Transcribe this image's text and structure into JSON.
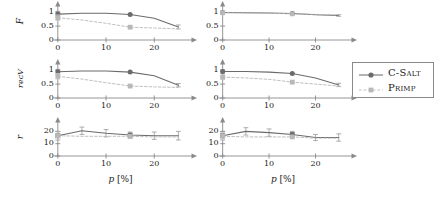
{
  "figure": {
    "width": 442,
    "height": 199,
    "background": "#ffffff",
    "colors": {
      "csalt": "#6b6b6b",
      "primp": "#b8b8b8",
      "axis": "#8a8a8a",
      "text": "#1a1a1a"
    }
  },
  "legend": {
    "position": "right-middle",
    "entries": [
      {
        "label": "C-Salt",
        "marker": "circle",
        "line": "solid",
        "color": "#6b6b6b"
      },
      {
        "label": "Primp",
        "marker": "square",
        "line": "dashed",
        "color": "#b8b8b8"
      }
    ]
  },
  "axis_titles": {
    "x_italic": "p",
    "x_unit": "[%]",
    "rows": [
      "F",
      "recV",
      "r"
    ]
  },
  "chart_data": [
    {
      "type": "line",
      "panel": "top-left",
      "title": "",
      "xlabel": "p [%]",
      "ylabel": "F",
      "xlim": [
        -1,
        27
      ],
      "ylim": [
        0,
        1.15
      ],
      "xticks": [
        0,
        10,
        20
      ],
      "yticks": [
        0,
        0.5,
        1
      ],
      "grid": false,
      "x": [
        0,
        5,
        10,
        15,
        20,
        25
      ],
      "series": [
        {
          "name": "C-Salt",
          "marker": "circle",
          "line": "solid",
          "color": "#6b6b6b",
          "values": [
            0.93,
            0.96,
            0.96,
            0.92,
            0.78,
            0.47
          ],
          "errors": [
            0.1,
            0.0,
            0.0,
            0.0,
            0.0,
            0.07
          ],
          "markers_at": [
            0,
            15
          ]
        },
        {
          "name": "Primp",
          "marker": "square",
          "line": "dashed",
          "color": "#b8b8b8",
          "values": [
            0.8,
            0.72,
            0.6,
            0.46,
            0.43,
            0.4
          ],
          "errors": [
            0.1,
            0.0,
            0.0,
            0.0,
            0.0,
            0.0
          ],
          "markers_at": [
            0,
            15
          ]
        }
      ]
    },
    {
      "type": "line",
      "panel": "top-right",
      "title": "",
      "xlabel": "p [%]",
      "ylabel": "F",
      "xlim": [
        -1,
        27
      ],
      "ylim": [
        0,
        1.15
      ],
      "xticks": [
        0,
        10,
        20
      ],
      "yticks": [
        0,
        0.5,
        1
      ],
      "grid": false,
      "x": [
        0,
        5,
        10,
        15,
        20,
        25
      ],
      "series": [
        {
          "name": "C-Salt",
          "marker": "circle",
          "line": "solid",
          "color": "#6b6b6b",
          "values": [
            0.99,
            0.98,
            0.97,
            0.95,
            0.91,
            0.88
          ],
          "errors": [
            0.04,
            0.0,
            0.0,
            0.0,
            0.0,
            0.03
          ],
          "markers_at": [
            0,
            15
          ]
        },
        {
          "name": "Primp",
          "marker": "square",
          "line": "dashed",
          "color": "#b8b8b8",
          "values": [
            0.98,
            0.97,
            0.96,
            0.94,
            0.92,
            0.9
          ],
          "errors": [
            0.04,
            0.0,
            0.0,
            0.0,
            0.0,
            0.0
          ],
          "markers_at": [
            0,
            15
          ]
        }
      ]
    },
    {
      "type": "line",
      "panel": "middle-left",
      "title": "",
      "xlabel": "p [%]",
      "ylabel": "recV",
      "xlim": [
        -1,
        27
      ],
      "ylim": [
        0,
        1.15
      ],
      "xticks": [
        0,
        10,
        20
      ],
      "yticks": [
        0,
        0.5,
        1
      ],
      "grid": false,
      "x": [
        0,
        5,
        10,
        15,
        20,
        25
      ],
      "series": [
        {
          "name": "C-Salt",
          "marker": "circle",
          "line": "solid",
          "color": "#6b6b6b",
          "values": [
            0.94,
            0.97,
            0.97,
            0.93,
            0.8,
            0.46
          ],
          "errors": [
            0.09,
            0.0,
            0.0,
            0.0,
            0.0,
            0.06
          ],
          "markers_at": [
            0,
            15
          ]
        },
        {
          "name": "Primp",
          "marker": "square",
          "line": "dashed",
          "color": "#b8b8b8",
          "values": [
            0.78,
            0.68,
            0.55,
            0.43,
            0.4,
            0.38
          ],
          "errors": [
            0.1,
            0.0,
            0.0,
            0.0,
            0.0,
            0.0
          ],
          "markers_at": [
            0,
            15
          ]
        }
      ]
    },
    {
      "type": "line",
      "panel": "middle-right",
      "title": "",
      "xlabel": "p [%]",
      "ylabel": "recV",
      "xlim": [
        -1,
        27
      ],
      "ylim": [
        0,
        1.15
      ],
      "xticks": [
        0,
        10,
        20
      ],
      "yticks": [
        0,
        0.5,
        1
      ],
      "grid": false,
      "x": [
        0,
        5,
        10,
        15,
        20,
        25
      ],
      "series": [
        {
          "name": "C-Salt",
          "marker": "circle",
          "line": "solid",
          "color": "#6b6b6b",
          "values": [
            0.95,
            0.95,
            0.93,
            0.88,
            0.72,
            0.47
          ],
          "errors": [
            0.06,
            0.0,
            0.0,
            0.0,
            0.0,
            0.06
          ],
          "markers_at": [
            0,
            15
          ]
        },
        {
          "name": "Primp",
          "marker": "square",
          "line": "dashed",
          "color": "#b8b8b8",
          "values": [
            0.75,
            0.72,
            0.67,
            0.57,
            0.5,
            0.43
          ],
          "errors": [
            0.08,
            0.0,
            0.0,
            0.0,
            0.0,
            0.0
          ],
          "markers_at": [
            0,
            15
          ]
        }
      ]
    },
    {
      "type": "line",
      "panel": "bottom-left",
      "title": "",
      "xlabel": "p [%]",
      "ylabel": "r",
      "xlim": [
        -1,
        27
      ],
      "ylim": [
        0,
        26
      ],
      "xticks": [
        0,
        10,
        20
      ],
      "yticks": [
        0,
        10,
        20
      ],
      "grid": false,
      "x": [
        0,
        5,
        10,
        15,
        20,
        25
      ],
      "series": [
        {
          "name": "C-Salt",
          "marker": "square",
          "line": "solid",
          "color": "#6b6b6b",
          "values": [
            16.5,
            20.5,
            18.5,
            17.0,
            16.5,
            16.5
          ],
          "errors": [
            3.5,
            3.0,
            3.0,
            2.5,
            3.0,
            3.5
          ],
          "markers_at": [
            0,
            15
          ]
        },
        {
          "name": "Primp",
          "marker": "square",
          "line": "dashed",
          "color": "#b8b8b8",
          "values": [
            16.5,
            16.0,
            16.0,
            16.0,
            15.5,
            15.5
          ],
          "errors": [
            3.0,
            0.0,
            0.0,
            0.0,
            0.0,
            0.0
          ],
          "markers_at": [
            0,
            15
          ]
        }
      ]
    },
    {
      "type": "line",
      "panel": "bottom-right",
      "title": "",
      "xlabel": "p [%]",
      "ylabel": "r",
      "xlim": [
        -1,
        27
      ],
      "ylim": [
        0,
        26
      ],
      "xticks": [
        0,
        10,
        20
      ],
      "yticks": [
        0,
        10,
        20
      ],
      "grid": false,
      "x": [
        0,
        5,
        10,
        15,
        20,
        25
      ],
      "series": [
        {
          "name": "C-Salt",
          "marker": "square",
          "line": "solid",
          "color": "#6b6b6b",
          "values": [
            16.5,
            20.0,
            19.0,
            17.5,
            15.0,
            15.0
          ],
          "errors": [
            3.5,
            3.0,
            3.0,
            2.5,
            2.5,
            3.0
          ],
          "markers_at": [
            0,
            15
          ]
        },
        {
          "name": "Primp",
          "marker": "square",
          "line": "dashed",
          "color": "#b8b8b8",
          "values": [
            16.0,
            15.5,
            15.5,
            15.5,
            14.5,
            14.5
          ],
          "errors": [
            3.0,
            0.0,
            0.0,
            0.0,
            0.0,
            0.0
          ],
          "markers_at": [
            0,
            15
          ]
        }
      ]
    }
  ]
}
